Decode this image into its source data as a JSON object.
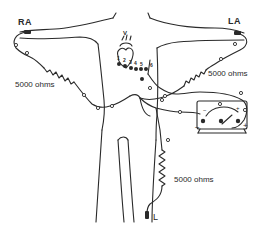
{
  "figure": {
    "leads": {
      "right_arm": "RA",
      "left_arm": "LA",
      "left_leg": "L"
    },
    "resistors": [
      {
        "id": "r-ra",
        "label": "5000 ohms"
      },
      {
        "id": "r-la",
        "label": "5000 ohms"
      },
      {
        "id": "r-ll",
        "label": "5000 ohms"
      }
    ],
    "chest_electrodes": [
      "1",
      "2",
      "3",
      "4",
      "5",
      "6"
    ],
    "chest_label_v": "V",
    "meter": {
      "neg_label": "−",
      "pos_label": "+",
      "scale_neg": "−",
      "scale_pos": "+"
    },
    "colors": {
      "ink": "#2a2a2a",
      "background": "#ffffff"
    }
  }
}
